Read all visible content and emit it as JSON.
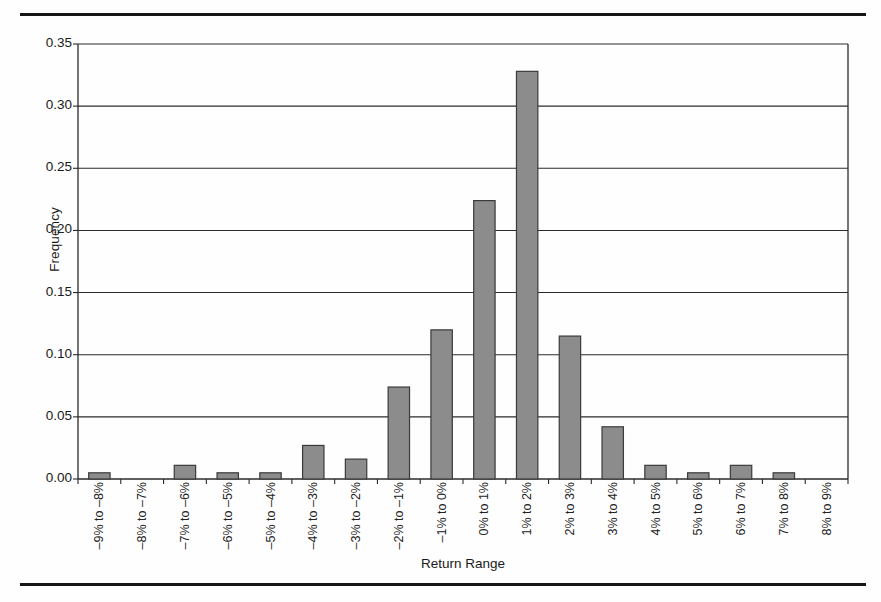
{
  "figure": {
    "kind": "histogram-figure",
    "top_rule": true,
    "bottom_rule": true,
    "frame_color": "#161616",
    "bar_fill": "#8c8c8c",
    "bar_border": "#3a3a3a",
    "gridline_color": "#2b2b2b",
    "plot_border_color": "#2b2b2b"
  },
  "chart_data": {
    "type": "bar",
    "title": "",
    "xlabel": "Return Range",
    "ylabel": "Frequency",
    "ylim": [
      0,
      0.35
    ],
    "yticks": [
      "0.00",
      "0.05",
      "0.10",
      "0.15",
      "0.20",
      "0.25",
      "0.30",
      "0.35"
    ],
    "ytick_values": [
      0.0,
      0.05,
      0.1,
      0.15,
      0.2,
      0.25,
      0.3,
      0.35
    ],
    "grid": "horizontal",
    "legend": "none",
    "categories": [
      "–9% to –8%",
      "–8% to –7%",
      "–7% to –6%",
      "–6% to –5%",
      "–5% to –4%",
      "–4% to –3%",
      "–3% to –2%",
      "–2% to –1%",
      "–1% to 0%",
      "0% to 1%",
      "1% to 2%",
      "2% to 3%",
      "3% to 4%",
      "4% to 5%",
      "5% to 6%",
      "6% to 7%",
      "7% to 8%",
      "8% to 9%"
    ],
    "values": [
      0.005,
      0.0,
      0.011,
      0.005,
      0.005,
      0.027,
      0.016,
      0.074,
      0.12,
      0.224,
      0.328,
      0.115,
      0.042,
      0.011,
      0.005,
      0.011,
      0.005,
      0.0
    ]
  },
  "ghost_text": {
    "top": "",
    "bottom": ""
  }
}
